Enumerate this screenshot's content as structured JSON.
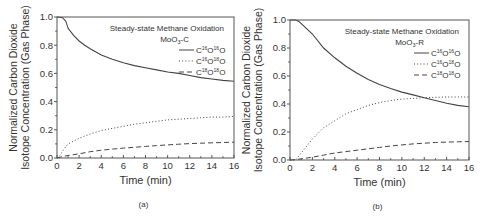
{
  "chart_data": [
    {
      "id": "a",
      "type": "line",
      "panel_label": "(a)",
      "title": "Steady-state Methane Oxidation",
      "subtitle": "MoO3-C",
      "subtitle_main": "MoO",
      "subtitle_sub": "3",
      "subtitle_tail": "-C",
      "xlabel": "Time (min)",
      "ylabel_line1": "Normalized Carbon Dioxide",
      "ylabel_line2": "Isotope Concentration (Gas Phase)",
      "xlim": [
        0,
        16
      ],
      "ylim": [
        0,
        1.0
      ],
      "xticks": [
        "0",
        "2",
        "4",
        "6",
        "8",
        "10",
        "12",
        "14",
        "16"
      ],
      "yticks": [
        "0.0",
        "0.2",
        "0.4",
        "0.6",
        "0.8",
        "1.0"
      ],
      "grid": false,
      "legend_position": "upper right",
      "frame": {
        "x0": 57,
        "x1": 234,
        "y0": 17,
        "y1": 158
      },
      "series": [
        {
          "name": "C16O16O",
          "style": "solid",
          "x": [
            0,
            0.5,
            0.8,
            1,
            1.5,
            2,
            2.5,
            3,
            4,
            5,
            6,
            7,
            8,
            9,
            10,
            11,
            12,
            13,
            14,
            15,
            16
          ],
          "y": [
            1.0,
            0.995,
            0.97,
            0.92,
            0.87,
            0.83,
            0.8,
            0.775,
            0.73,
            0.7,
            0.675,
            0.655,
            0.64,
            0.625,
            0.61,
            0.6,
            0.585,
            0.57,
            0.56,
            0.55,
            0.545
          ]
        },
        {
          "name": "C16O18O",
          "style": "dotted",
          "x": [
            0,
            0.3,
            0.6,
            1,
            2,
            3,
            4,
            5,
            6,
            7,
            8,
            9,
            10,
            11,
            12,
            13,
            14,
            15,
            16
          ],
          "y": [
            0,
            0.02,
            0.06,
            0.1,
            0.14,
            0.17,
            0.195,
            0.21,
            0.225,
            0.24,
            0.25,
            0.26,
            0.27,
            0.275,
            0.28,
            0.285,
            0.29,
            0.29,
            0.295
          ]
        },
        {
          "name": "C18O18O",
          "style": "dashed",
          "x": [
            0,
            0.5,
            1,
            2,
            3,
            4,
            5,
            6,
            7,
            8,
            9,
            10,
            11,
            12,
            13,
            14,
            15,
            16
          ],
          "y": [
            0,
            0.01,
            0.018,
            0.03,
            0.045,
            0.055,
            0.063,
            0.07,
            0.076,
            0.082,
            0.088,
            0.093,
            0.098,
            0.102,
            0.105,
            0.108,
            0.11,
            0.112
          ]
        }
      ],
      "legend": [
        {
          "style": "solid",
          "iso1": "16",
          "iso2": "16"
        },
        {
          "style": "dotted",
          "iso1": "16",
          "iso2": "18"
        },
        {
          "style": "dashed",
          "iso1": "18",
          "iso2": "18"
        }
      ]
    },
    {
      "id": "b",
      "type": "line",
      "panel_label": "(b)",
      "title": "Steady-state Methane Oxidation",
      "subtitle": "MoO3-R",
      "subtitle_main": "MoO",
      "subtitle_sub": "3",
      "subtitle_tail": "-R",
      "xlabel": "Time (min)",
      "ylabel_line1": "Normalized Carbon Dioxide",
      "ylabel_line2": "Isotope Concentration (Gas Phase)",
      "xlim": [
        0,
        16
      ],
      "ylim": [
        0,
        1.0
      ],
      "xticks": [
        "0",
        "2",
        "4",
        "6",
        "8",
        "10",
        "12",
        "14",
        "16"
      ],
      "yticks": [
        "0.0",
        "0.2",
        "0.4",
        "0.6",
        "0.8",
        "1.0"
      ],
      "grid": false,
      "legend_position": "upper right",
      "frame": {
        "x0": 290,
        "x1": 469,
        "y0": 20,
        "y1": 160
      },
      "series": [
        {
          "name": "C16O16O",
          "style": "solid",
          "x": [
            0,
            0.5,
            0.8,
            1.2,
            2,
            3,
            4,
            5,
            6,
            7,
            8,
            9,
            10,
            11,
            12,
            13,
            14,
            15,
            16
          ],
          "y": [
            1.0,
            1.0,
            0.99,
            0.96,
            0.9,
            0.8,
            0.73,
            0.67,
            0.62,
            0.575,
            0.54,
            0.51,
            0.485,
            0.465,
            0.445,
            0.425,
            0.405,
            0.39,
            0.38
          ]
        },
        {
          "name": "C16O18O",
          "style": "dotted",
          "x": [
            0,
            0.5,
            1,
            1.5,
            2,
            3,
            4,
            5,
            6,
            7,
            8,
            9,
            10,
            11,
            12,
            13,
            14,
            15,
            16
          ],
          "y": [
            0,
            0.0,
            0.05,
            0.1,
            0.15,
            0.23,
            0.28,
            0.33,
            0.36,
            0.39,
            0.41,
            0.425,
            0.435,
            0.44,
            0.445,
            0.448,
            0.45,
            0.45,
            0.45
          ]
        },
        {
          "name": "C18O18O",
          "style": "dashed",
          "x": [
            0,
            0.5,
            1,
            2,
            3,
            4,
            5,
            6,
            7,
            8,
            9,
            10,
            11,
            12,
            13,
            14,
            15,
            16
          ],
          "y": [
            0,
            0.003,
            0.008,
            0.02,
            0.035,
            0.05,
            0.06,
            0.07,
            0.08,
            0.09,
            0.1,
            0.108,
            0.115,
            0.12,
            0.125,
            0.128,
            0.13,
            0.132
          ]
        }
      ],
      "legend": [
        {
          "style": "solid",
          "iso1": "16",
          "iso2": "16"
        },
        {
          "style": "dotted",
          "iso1": "16",
          "iso2": "18"
        },
        {
          "style": "dashed",
          "iso1": "18",
          "iso2": "18"
        }
      ]
    }
  ]
}
